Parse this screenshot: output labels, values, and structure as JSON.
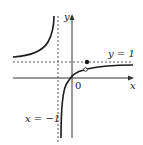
{
  "figure": {
    "axes": {
      "x_label": "x",
      "y_label": "y",
      "origin_label": "0"
    },
    "asymptotes": {
      "vertical_label": "x = −1",
      "horizontal_label": "y = 1"
    },
    "points": {
      "filled_point": "point on line y = 1",
      "open_point": "hole on curve near y = 1"
    },
    "colors": {
      "curve": "#1a1a1a",
      "axes": "#333333",
      "asymptote": "#555555",
      "background": "#ffffff"
    }
  }
}
